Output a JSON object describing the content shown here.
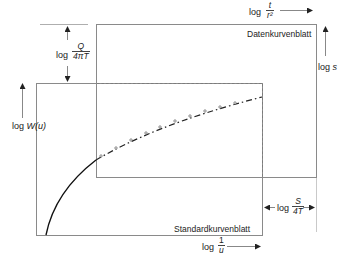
{
  "diagram": {
    "type": "type-curve-matching",
    "sheets": {
      "data_sheet": {
        "label": "Datenkurvenblatt"
      },
      "standard_sheet": {
        "label": "Standardkurvenblatt"
      }
    },
    "axes": {
      "standard_y": {
        "prefix": "log",
        "var": "W(u)"
      },
      "standard_x": {
        "prefix": "log",
        "num": "1",
        "den": "u"
      },
      "data_x": {
        "prefix": "log",
        "num": "t",
        "den": "r²"
      },
      "data_y": {
        "prefix": "log",
        "var": "s"
      }
    },
    "offsets": {
      "vertical": {
        "prefix": "log",
        "num": "Q",
        "den": "4πT"
      },
      "horizontal": {
        "prefix": "log",
        "num": "S",
        "den": "4T"
      }
    },
    "colors": {
      "frame": "#8a8a8a",
      "curve": "#111111",
      "dashed": "#777777"
    }
  }
}
